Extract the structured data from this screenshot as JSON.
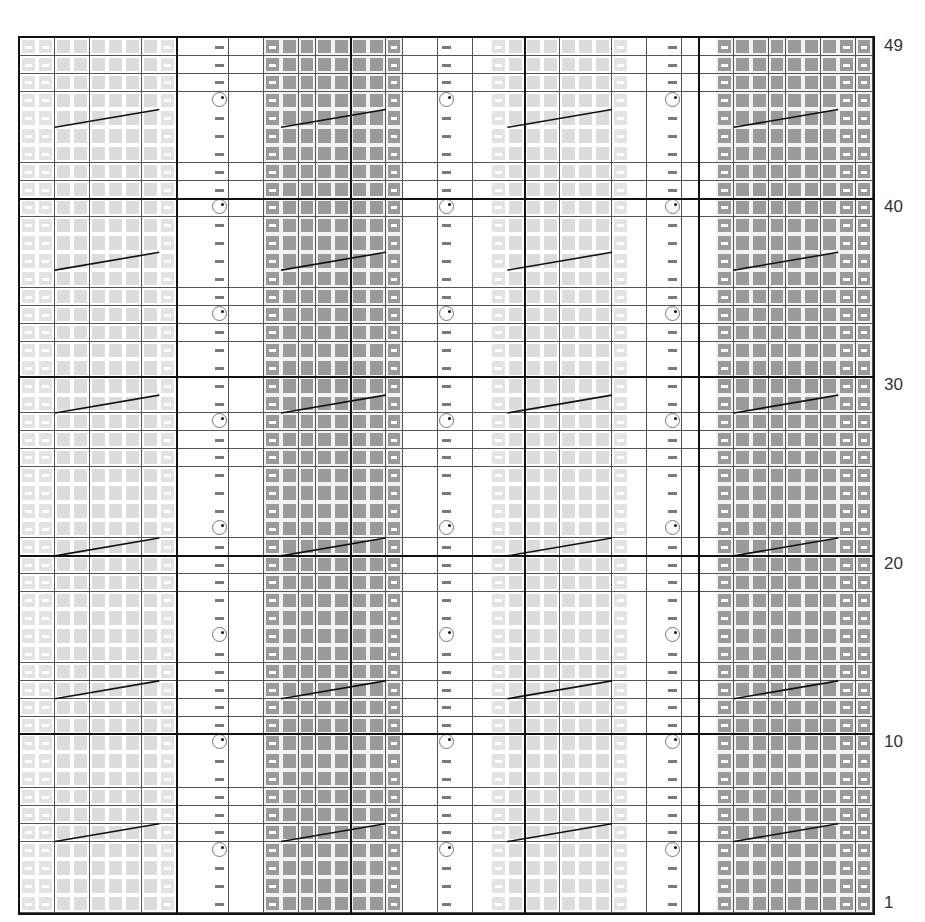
{
  "grid": {
    "columns": 49,
    "rows": 49,
    "major_every": 10
  },
  "row_labels": [
    {
      "row": 49,
      "text": "49"
    },
    {
      "row": 40,
      "text": "40"
    },
    {
      "row": 30,
      "text": "30"
    },
    {
      "row": 20,
      "text": "20"
    },
    {
      "row": 10,
      "text": "10"
    },
    {
      "row": 1,
      "text": "1"
    }
  ],
  "column_types": [
    "lightdash",
    "lightdash",
    "lightsq",
    "lightsq",
    "lightsq",
    "lightsq",
    "lightsq",
    "lightsq",
    "lightdash",
    "white",
    "white",
    "yo",
    "white",
    "white",
    "darkdash",
    "darksq",
    "darksq",
    "darksq",
    "darksq",
    "darksq",
    "darksq",
    "darkdash",
    "white",
    "white",
    "yo",
    "white",
    "white",
    "lightdash",
    "lightsq",
    "lightsq",
    "lightsq",
    "lightsq",
    "lightsq",
    "lightsq",
    "lightdash",
    "white",
    "white",
    "yo",
    "white",
    "white",
    "darkdash",
    "darksq",
    "darksq",
    "darksq",
    "darksq",
    "darksq",
    "darksq",
    "darkdash",
    "darkdash"
  ],
  "yarn_over_rows": [
    4,
    10,
    16,
    22,
    28,
    34,
    40,
    46
  ],
  "cable_rows": [
    5,
    13,
    21,
    29,
    37,
    45
  ],
  "cable_spans": [
    {
      "from_col": 2,
      "to_col": 7
    },
    {
      "from_col": 15,
      "to_col": 20
    },
    {
      "from_col": 28,
      "to_col": 33
    },
    {
      "from_col": 41,
      "to_col": 46
    }
  ],
  "legend_symbols": {
    "white": "knit on RS (blank)",
    "yo": "yarn over (circle)",
    "purl": "purl (dash)",
    "lightsq": "light contrast stitch",
    "darksq": "dark contrast stitch",
    "lightdash": "light color purl",
    "darkdash": "dark color purl",
    "cable": "cable cross line"
  },
  "colors": {
    "grid_line": "#555555",
    "major_line": "#111111",
    "light_fill": "#dcdcdc",
    "dark_fill": "#9a9a9a",
    "purl_mark": "#7a7a7a"
  }
}
